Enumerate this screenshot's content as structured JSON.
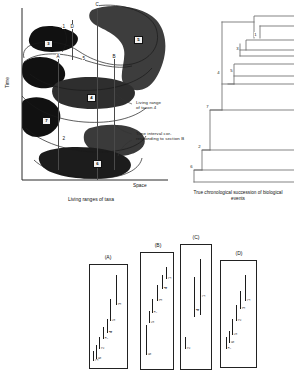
{
  "figure": {
    "panels": [
      "living-ranges",
      "true-chronological-tree",
      "stratigraphic-sections"
    ]
  },
  "panel_ranges": {
    "axis_y_label": "Time",
    "axis_x_label": "Space",
    "caption": "Living ranges of taxa",
    "taxa": [
      {
        "id": "1",
        "label": "1"
      },
      {
        "id": "2",
        "label": "2"
      },
      {
        "id": "3",
        "label": "3"
      },
      {
        "id": "4",
        "label": "4"
      },
      {
        "id": "5",
        "label": "5"
      },
      {
        "id": "6",
        "label": "6"
      },
      {
        "id": "7",
        "label": "7"
      }
    ],
    "taxon_chips": [
      {
        "label": "3",
        "x": 44,
        "y": 42
      },
      {
        "label": "5",
        "x": 134,
        "y": 38
      },
      {
        "label": "4",
        "x": 87,
        "y": 97
      },
      {
        "label": "7",
        "x": 42,
        "y": 120
      },
      {
        "label": "6",
        "x": 93,
        "y": 162
      }
    ],
    "section_markers": [
      {
        "label": "C",
        "x": 97,
        "y": 6
      },
      {
        "label": "D",
        "x": 72,
        "y": 28
      },
      {
        "label": "1",
        "x": 64,
        "y": 27
      },
      {
        "label": "A",
        "x": 57,
        "y": 58
      },
      {
        "label": "5",
        "x": 83,
        "y": 60
      },
      {
        "label": "B",
        "x": 113,
        "y": 58
      }
    ],
    "annotations": [
      {
        "name": "living-range-taxon-4",
        "text": "Living range\nof taxon 4",
        "x": 135,
        "y": 100
      },
      {
        "name": "time-interval-section-b",
        "text": "Time interval cor-\nresponding to section B",
        "x": 135,
        "y": 131
      }
    ]
  },
  "panel_tree": {
    "caption": "True chronological succession\nof biological events",
    "nodes": [
      {
        "label": "1",
        "x": 76,
        "y": 34
      },
      {
        "label": "3",
        "x": 64,
        "y": 44
      },
      {
        "label": "4",
        "x": 36,
        "y": 70
      },
      {
        "label": "5",
        "x": 52,
        "y": 69
      },
      {
        "label": "7",
        "x": 28,
        "y": 106
      },
      {
        "label": "2",
        "x": 20,
        "y": 146
      },
      {
        "label": "6",
        "x": 12,
        "y": 166
      }
    ]
  },
  "panel_sections": {
    "sections": [
      {
        "label": "(A)",
        "box": {
          "x": 89,
          "y": 40,
          "w": 37,
          "h": 103
        },
        "ranges": [
          {
            "taxon": "3",
            "top": 10,
            "height": 30,
            "x": 26
          },
          {
            "taxon": "5",
            "top": 34,
            "height": 22,
            "x": 20
          },
          {
            "taxon": "4",
            "top": 54,
            "height": 14,
            "x": 17
          },
          {
            "taxon": "7",
            "top": 62,
            "height": 12,
            "x": 13
          },
          {
            "taxon": "2",
            "top": 72,
            "height": 12,
            "x": 9
          },
          {
            "taxon": "6",
            "top": 80,
            "height": 14,
            "x": 6
          },
          {
            "taxon": "1",
            "top": 86,
            "height": 10,
            "x": 3
          }
        ]
      },
      {
        "label": "(B)",
        "box": {
          "x": 140,
          "y": 28,
          "w": 32,
          "h": 116
        },
        "ranges": [
          {
            "taxon": "1",
            "top": 14,
            "height": 12,
            "x": 25
          },
          {
            "taxon": "4",
            "top": 22,
            "height": 14,
            "x": 21
          },
          {
            "taxon": "3",
            "top": 32,
            "height": 16,
            "x": 16
          },
          {
            "taxon": "7",
            "top": 46,
            "height": 14,
            "x": 11
          },
          {
            "taxon": "5",
            "top": 58,
            "height": 12,
            "x": 8
          },
          {
            "taxon": "6",
            "top": 72,
            "height": 30,
            "x": 5
          }
        ]
      },
      {
        "label": "(C)",
        "box": {
          "x": 180,
          "y": 20,
          "w": 30,
          "h": 124
        },
        "ranges": [
          {
            "taxon": "1",
            "top": 14,
            "height": 56,
            "x": 19
          },
          {
            "taxon": "4",
            "top": 32,
            "height": 40,
            "x": 13
          },
          {
            "taxon": "2",
            "top": 92,
            "height": 12,
            "x": 4
          }
        ]
      },
      {
        "label": "(D)",
        "box": {
          "x": 220,
          "y": 36,
          "w": 35,
          "h": 106
        },
        "ranges": [
          {
            "taxon": "1",
            "top": 14,
            "height": 26,
            "x": 24
          },
          {
            "taxon": "3",
            "top": 30,
            "height": 18,
            "x": 19
          },
          {
            "taxon": "2",
            "top": 44,
            "height": 16,
            "x": 15
          },
          {
            "taxon": "5",
            "top": 58,
            "height": 16,
            "x": 11
          },
          {
            "taxon": "6",
            "top": 70,
            "height": 12,
            "x": 8
          },
          {
            "taxon": "7",
            "top": 76,
            "height": 12,
            "x": 5
          }
        ]
      }
    ]
  }
}
